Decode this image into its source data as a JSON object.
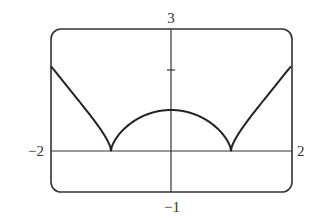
{
  "chart_data": {
    "type": "line",
    "title": "",
    "xlabel": "",
    "ylabel": "",
    "xlim": [
      -2,
      2
    ],
    "ylim": [
      -1,
      3
    ],
    "grid": false,
    "legend": null,
    "axis_labels": {
      "x_min": "−2",
      "x_max": "2",
      "y_max": "3",
      "y_min": "−1"
    },
    "y_ticks": [
      2
    ],
    "series": [
      {
        "name": "y = |x^2 - 1|^(2/3)",
        "x": [
          -2,
          -1.75,
          -1.5,
          -1.25,
          -1,
          -0.75,
          -0.5,
          -0.25,
          0,
          0.25,
          0.5,
          0.75,
          1,
          1.25,
          1.5,
          1.75,
          2
        ],
        "y": [
          2.08,
          1.64,
          1.16,
          0.67,
          0,
          0.61,
          0.83,
          0.96,
          1.0,
          0.96,
          0.83,
          0.61,
          0,
          0.67,
          1.16,
          1.64,
          2.08
        ]
      }
    ],
    "annotations": [
      "cusps at x = -1 and x = 1 on the x-axis",
      "local max at (0, 1)"
    ]
  },
  "style": {
    "curve_color": "#222222",
    "axis_color": "#333333",
    "frame_color": "#333333"
  }
}
